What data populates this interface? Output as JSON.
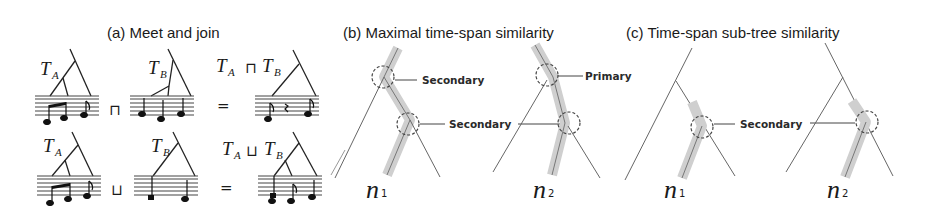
{
  "panels": {
    "a": {
      "title": "(a) Meet and join",
      "meet": {
        "left_tree": "T",
        "left_sub": "A",
        "right_tree": "T",
        "right_sub": "B",
        "operator": "⊓",
        "equals": "=",
        "result_left": "T",
        "result_left_sub": "A",
        "result_op": "⊓",
        "result_right": "T",
        "result_right_sub": "B"
      },
      "join": {
        "left_tree": "T",
        "left_sub": "A",
        "right_tree": "T",
        "right_sub": "B",
        "operator": "⊔",
        "equals": "=",
        "result_left": "T",
        "result_left_sub": "A",
        "result_op": "⊔",
        "result_right": "T",
        "result_right_sub": "B"
      }
    },
    "b": {
      "title": "(b) Maximal time-span similarity",
      "tree1": {
        "label": "n",
        "sub": "1",
        "callouts": [
          "Secondary",
          "Secondary"
        ]
      },
      "tree2": {
        "label": "n",
        "sub": "2",
        "callouts": [
          "Primary",
          "Secondary"
        ]
      },
      "shared_callout": "Secondary"
    },
    "c": {
      "title": "(c) Time-span sub-tree similarity",
      "tree1": {
        "label": "n",
        "sub": "1"
      },
      "tree2": {
        "label": "n",
        "sub": "2"
      },
      "shared_callout": "Secondary"
    }
  },
  "colors": {
    "line": "#3a3a3a",
    "highlight_band": "#c8c8c8",
    "dashed_circle": "#444444",
    "background": "#ffffff"
  }
}
